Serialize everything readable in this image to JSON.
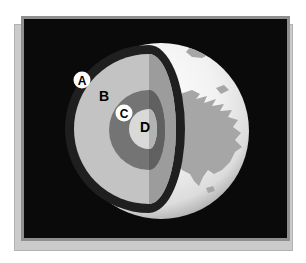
{
  "figure": {
    "description": "Cutaway diagram of Earth's interior layers shown inside a black framed slide over a gray shadow card",
    "labels": [
      {
        "id": "A",
        "badge": true
      },
      {
        "id": "B",
        "badge": false
      },
      {
        "id": "C",
        "badge": true
      },
      {
        "id": "D",
        "badge": false
      }
    ],
    "colors": {
      "page_background": "#ffffff",
      "card": "#cbcbcb",
      "panel_background": "#0a0a0a",
      "panel_border": "#8f8f8f",
      "crust_ring": "#1f1f1f",
      "mantle_lit": "#c3c3c3",
      "mantle_shadow": "#9c9c9c",
      "outer_core_lit": "#747474",
      "outer_core_shadow": "#606060",
      "inner_core_lit": "#d9d9d9",
      "inner_core_shadow": "#b3b3b3",
      "globe_surface": "#f2f2f2",
      "continent": "#a6a6a6",
      "label_badge": "#ffffff",
      "label_text": "#000000"
    }
  }
}
